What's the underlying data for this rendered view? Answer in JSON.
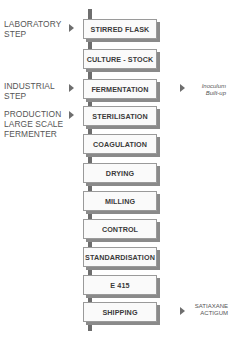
{
  "diagram": {
    "type": "process-flow",
    "left_labels": [
      {
        "lines": [
          "LABORATORY",
          "STEP"
        ]
      },
      {
        "lines": [
          "INDUSTRIAL",
          "STEP"
        ]
      },
      {
        "lines": [
          "PRODUCTION",
          "LARGE SCALE",
          "FERMENTER"
        ]
      }
    ],
    "steps": [
      "STIRRED FLASK",
      "CULTURE - STOCK",
      "FERMENTATION",
      "STERILISATION",
      "COAGULATION",
      "DRYING",
      "MILLING",
      "CONTROL",
      "STANDARDISATION",
      "E 415",
      "SHIPPING"
    ],
    "right_notes": [
      {
        "lines": [
          "Inoculum",
          "Built-up"
        ],
        "attached_to": "FERMENTATION"
      },
      {
        "lines": [
          "SATIAXANE",
          "ACTIGUM"
        ],
        "attached_to": "SHIPPING"
      }
    ],
    "colors": {
      "connector": "#6e6e6e",
      "box_border": "#9a9a9a",
      "box_shadow": "#8a8a8a",
      "text": "#3a3a3a"
    }
  }
}
